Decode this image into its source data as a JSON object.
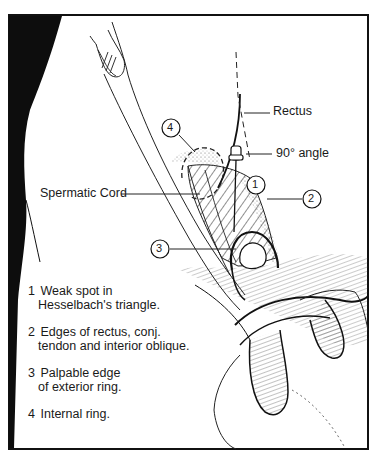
{
  "figure": {
    "labels": {
      "rectus": "Rectus",
      "angle": "90° angle",
      "spermatic_cord": "Spermatic Cord"
    },
    "callouts": [
      {
        "number": "1"
      },
      {
        "number": "2"
      },
      {
        "number": "3"
      },
      {
        "number": "4"
      }
    ],
    "legend": [
      {
        "number": "1",
        "line1": "Weak spot in",
        "line2": "Hesselbach's triangle."
      },
      {
        "number": "2",
        "line1": "Edges of rectus, conj.",
        "line2": "tendon and interior oblique."
      },
      {
        "number": "3",
        "line1": "Palpable edge",
        "line2": "of exterior ring."
      },
      {
        "number": "4",
        "line1": "Internal ring.",
        "line2": ""
      }
    ],
    "footer_fragment": ""
  }
}
